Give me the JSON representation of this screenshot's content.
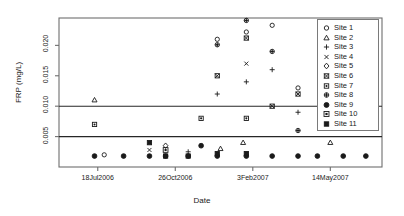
{
  "chart_data": {
    "type": "scatter",
    "title": "",
    "xlabel": "Date",
    "ylabel": "FRP (mg/L)",
    "ylim": [
      0.0,
      0.0245
    ],
    "yticks": [
      0.005,
      0.01,
      0.015,
      0.02
    ],
    "ytick_labels": [
      "0.005",
      "0.010",
      "0.015",
      "0.020"
    ],
    "xlim": [
      0,
      100
    ],
    "xticks": [
      12,
      36,
      60,
      84
    ],
    "xtick_labels": [
      "18Jul2006",
      "26Oct2006",
      "3Feb2007",
      "14May2007"
    ],
    "grid": false,
    "legend_position": "top-right",
    "reference_lines": [
      {
        "y": 0.01,
        "orientation": "horizontal"
      },
      {
        "y": 0.005,
        "orientation": "horizontal"
      }
    ],
    "series": [
      {
        "name": "Site 1",
        "symbol": "open-circle",
        "points": [
          {
            "x": 14,
            "y": 0.002
          },
          {
            "x": 49,
            "y": 0.021
          },
          {
            "x": 58,
            "y": 0.0222
          },
          {
            "x": 66,
            "y": 0.0233
          },
          {
            "x": 74,
            "y": 0.013
          }
        ]
      },
      {
        "name": "Site 2",
        "symbol": "open-triangle",
        "points": [
          {
            "x": 11,
            "y": 0.011
          },
          {
            "x": 50,
            "y": 0.003
          },
          {
            "x": 57,
            "y": 0.004
          },
          {
            "x": 84,
            "y": 0.004
          }
        ]
      },
      {
        "name": "Site 3",
        "symbol": "plus",
        "points": [
          {
            "x": 40,
            "y": 0.0025
          },
          {
            "x": 49,
            "y": 0.012
          },
          {
            "x": 58,
            "y": 0.014
          },
          {
            "x": 66,
            "y": 0.016
          },
          {
            "x": 74,
            "y": 0.009
          }
        ]
      },
      {
        "name": "Site 4",
        "symbol": "cross",
        "points": [
          {
            "x": 28,
            "y": 0.0028
          },
          {
            "x": 58,
            "y": 0.017
          }
        ]
      },
      {
        "name": "Site 5",
        "symbol": "open-diamond",
        "points": [
          {
            "x": 33,
            "y": 0.0035
          }
        ]
      },
      {
        "name": "Site 6",
        "symbol": "square-cross",
        "points": [
          {
            "x": 49,
            "y": 0.015
          },
          {
            "x": 58,
            "y": 0.0212
          },
          {
            "x": 66,
            "y": 0.01
          },
          {
            "x": 74,
            "y": 0.012
          }
        ]
      },
      {
        "name": "Site 7",
        "symbol": "square-dot",
        "points": [
          {
            "x": 11,
            "y": 0.007
          },
          {
            "x": 44,
            "y": 0.008
          },
          {
            "x": 58,
            "y": 0.008
          }
        ]
      },
      {
        "name": "Site 8",
        "symbol": "circle-plus",
        "points": [
          {
            "x": 49,
            "y": 0.0201
          },
          {
            "x": 58,
            "y": 0.0241
          },
          {
            "x": 66,
            "y": 0.019
          },
          {
            "x": 74,
            "y": 0.006
          }
        ]
      },
      {
        "name": "Site 9",
        "symbol": "filled-circle",
        "points": [
          {
            "x": 11,
            "y": 0.0018
          },
          {
            "x": 20,
            "y": 0.0018
          },
          {
            "x": 28,
            "y": 0.0018
          },
          {
            "x": 33,
            "y": 0.0018
          },
          {
            "x": 40,
            "y": 0.0018
          },
          {
            "x": 44,
            "y": 0.0035
          },
          {
            "x": 49,
            "y": 0.0018
          },
          {
            "x": 58,
            "y": 0.0018
          },
          {
            "x": 66,
            "y": 0.0018
          },
          {
            "x": 74,
            "y": 0.0018
          },
          {
            "x": 80,
            "y": 0.0018
          },
          {
            "x": 88,
            "y": 0.0018
          },
          {
            "x": 95,
            "y": 0.0018
          }
        ]
      },
      {
        "name": "Site 10",
        "symbol": "square-box",
        "points": [
          {
            "x": 33,
            "y": 0.0028
          }
        ]
      },
      {
        "name": "Site 11",
        "symbol": "filled-square",
        "points": [
          {
            "x": 28,
            "y": 0.004
          },
          {
            "x": 33,
            "y": 0.0018
          },
          {
            "x": 40,
            "y": 0.0018
          },
          {
            "x": 49,
            "y": 0.0022
          },
          {
            "x": 58,
            "y": 0.0022
          }
        ]
      }
    ]
  },
  "legend": {
    "entries": [
      {
        "label": "Site 1",
        "symbol": "open-circle"
      },
      {
        "label": "Site 2",
        "symbol": "open-triangle"
      },
      {
        "label": "Site 3",
        "symbol": "plus"
      },
      {
        "label": "Site 4",
        "symbol": "cross"
      },
      {
        "label": "Site 5",
        "symbol": "open-diamond"
      },
      {
        "label": "Site 6",
        "symbol": "square-cross"
      },
      {
        "label": "Site 7",
        "symbol": "square-dot"
      },
      {
        "label": "Site 8",
        "symbol": "circle-plus"
      },
      {
        "label": "Site 9",
        "symbol": "filled-circle"
      },
      {
        "label": "Site 10",
        "symbol": "square-box"
      },
      {
        "label": "Site 11",
        "symbol": "filled-square"
      }
    ]
  },
  "colors": {
    "foreground": "#1a1a1a",
    "frame": "#6e6e6e",
    "reference_line": "#262626",
    "background": "#ffffff"
  }
}
